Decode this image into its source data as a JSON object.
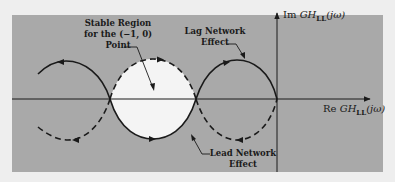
{
  "diagram": {
    "type": "nyquist-plot-sketch",
    "colors": {
      "page_background": "#eeeeee",
      "panel_background": "#a9a9a9",
      "stable_region": "#f4f4f4",
      "ink": "#1a1a1a"
    },
    "axes": {
      "real": {
        "prefix": "Re",
        "func": "GH",
        "subscript": "LL",
        "arg": "(jω)"
      },
      "imag": {
        "prefix": "Im",
        "func": "GH",
        "subscript": "LL",
        "arg": "(jω)"
      }
    },
    "annotations": {
      "stable_region": [
        "Stable Region",
        "for the (−1, 0)",
        "Point"
      ],
      "lag_network": [
        "Lag Network",
        "Effect"
      ],
      "lead_network": [
        "Lead Network",
        "Effect"
      ]
    },
    "curves": [
      {
        "name": "upper-left-arc",
        "style": "solid",
        "direction": "left"
      },
      {
        "name": "lower-left-arc",
        "style": "dashed",
        "direction": "left"
      },
      {
        "name": "lens-top-arc",
        "style": "dashed",
        "direction": "right"
      },
      {
        "name": "lens-bottom-arc",
        "style": "solid",
        "direction": "right"
      },
      {
        "name": "upper-right-arc",
        "style": "solid",
        "direction": "right"
      },
      {
        "name": "lower-right-arc",
        "style": "dashed",
        "direction": "left"
      }
    ]
  }
}
